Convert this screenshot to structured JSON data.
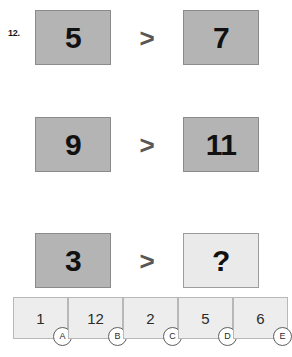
{
  "question": {
    "number_label": "12.",
    "type": "analogy-inequality-puzzle"
  },
  "colors": {
    "tile_dark_fill": "#b4b4b4",
    "tile_light_fill": "#eaeaea",
    "tile_border": "#8f8f8f",
    "option_fill": "#ededed",
    "option_border": "#b8b8b8",
    "operator_color": "#575757",
    "text_color": "#111111",
    "page_background": "#ffffff"
  },
  "rows": [
    {
      "left_value": "5",
      "operator": ">",
      "right_value": "7",
      "left_shade": "dark",
      "right_shade": "dark"
    },
    {
      "left_value": "9",
      "operator": ">",
      "right_value": "11",
      "left_shade": "dark",
      "right_shade": "dark"
    },
    {
      "left_value": "3",
      "operator": ">",
      "right_value": "?",
      "left_shade": "dark",
      "right_shade": "light"
    }
  ],
  "options": [
    {
      "value": "1",
      "letter": "A"
    },
    {
      "value": "12",
      "letter": "B"
    },
    {
      "value": "2",
      "letter": "C"
    },
    {
      "value": "5",
      "letter": "D"
    },
    {
      "value": "6",
      "letter": "E"
    }
  ]
}
